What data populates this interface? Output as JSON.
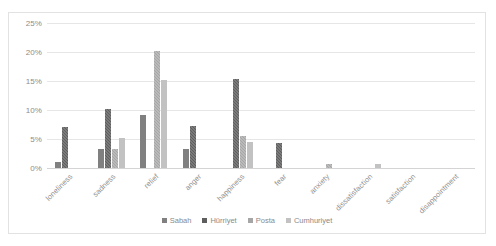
{
  "chart_data": {
    "type": "bar",
    "title": "",
    "xlabel": "",
    "ylabel": "",
    "ylim": [
      0,
      25
    ],
    "ytick_labels": [
      "0%",
      "5%",
      "10%",
      "15%",
      "20%",
      "25%"
    ],
    "ytick_values": [
      0,
      5,
      10,
      15,
      20,
      25
    ],
    "grid": true,
    "legend_position": "bottom-center",
    "categories": [
      "loneliness",
      "sadness",
      "relief",
      "anger",
      "happiness",
      "fear",
      "anxiety",
      "dissatisfaction",
      "satisfaction",
      "disappointment"
    ],
    "series": [
      {
        "name": "Sabah",
        "color": "#808080",
        "values": [
          1.0,
          3.2,
          9.1,
          3.2,
          0,
          0,
          0,
          0,
          0,
          0
        ]
      },
      {
        "name": "Hürriyet",
        "color": "#5e5e5e",
        "values": [
          7.0,
          10.1,
          0,
          7.2,
          15.3,
          4.3,
          0,
          0,
          0,
          0
        ]
      },
      {
        "name": "Posta",
        "color": "#a6a6a6",
        "values": [
          0,
          3.2,
          20.1,
          0,
          5.5,
          0,
          0.7,
          0,
          0,
          0
        ]
      },
      {
        "name": "Cumhuriyet",
        "color": "#c2c2c2",
        "values": [
          0,
          5.2,
          15.1,
          0,
          4.5,
          0,
          0,
          0.7,
          0,
          0
        ]
      }
    ]
  },
  "legend": {
    "items": [
      {
        "label": "Sabah"
      },
      {
        "label": "Hürriyet"
      },
      {
        "label": "Posta"
      },
      {
        "label": "Cumhuriyet"
      }
    ]
  }
}
